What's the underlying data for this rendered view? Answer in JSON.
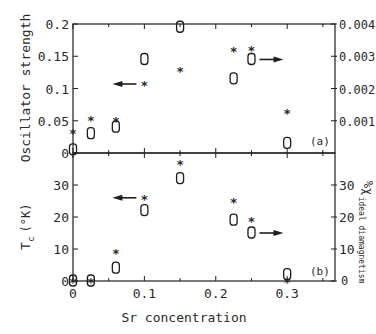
{
  "chart_data": [
    {
      "panel": "(a)",
      "type": "scatter",
      "xlabel": "Sr concentration",
      "ylabel_left": "Oscillator strength",
      "ylabel_right": "χ",
      "xlim": [
        0,
        0.367
      ],
      "ylim_left": [
        0,
        0.2
      ],
      "ylim_right": [
        0,
        0.004
      ],
      "yticks_left": [
        "0",
        "0.05",
        "0.1",
        "0.15",
        "0.2"
      ],
      "yticks_left_values": [
        0,
        0.05,
        0.1,
        0.15,
        0.2
      ],
      "yticks_right": [
        "0.001",
        "0.002",
        "0.003",
        "0.004"
      ],
      "yticks_right_values": [
        0.001,
        0.002,
        0.003,
        0.004
      ],
      "series": [
        {
          "name": "Oscillator strength",
          "marker": "*",
          "axis": "left",
          "x": [
            0,
            0.025,
            0.06,
            0.1,
            0.15,
            0.225,
            0.25,
            0.3
          ],
          "y": [
            0.033,
            0.052,
            0.051,
            0.107,
            0.129,
            0.16,
            0.162,
            0.064
          ]
        },
        {
          "name": "χ",
          "marker": "0",
          "axis": "right",
          "x": [
            0,
            0.025,
            0.06,
            0.1,
            0.15,
            0.225,
            0.25,
            0.3
          ],
          "y": [
            0.0001,
            0.0006,
            0.0008,
            0.0029,
            0.0039,
            0.0023,
            0.0029,
            0.0003
          ]
        }
      ],
      "annotations": [
        {
          "type": "arrow-left",
          "x": 0.1,
          "y": 0.107,
          "meaning": "stars refer to left axis"
        },
        {
          "type": "arrow-right",
          "x": 0.25,
          "y": 0.0029,
          "meaning": "zeros refer to right axis"
        },
        {
          "type": "label",
          "text": "(a)"
        }
      ]
    },
    {
      "panel": "(b)",
      "type": "scatter",
      "xlabel": "Sr concentration",
      "ylabel_left": "Tc (°K)",
      "ylabel_right": "χ ideal diamagnetism (%)",
      "xlim": [
        0,
        0.367
      ],
      "ylim_left": [
        0,
        40
      ],
      "ylim_right": [
        0,
        40
      ],
      "yticks_left": [
        "0",
        "10",
        "20",
        "30"
      ],
      "yticks_left_values": [
        0,
        10,
        20,
        30
      ],
      "yticks_right": [
        "0",
        "10",
        "20",
        "30"
      ],
      "yticks_right_values": [
        0,
        10,
        20,
        30
      ],
      "xticks": [
        "0",
        "0.1",
        "0.2",
        "0.3"
      ],
      "xticks_values": [
        0,
        0.1,
        0.2,
        0.3
      ],
      "series": [
        {
          "name": "Tc",
          "marker": "*",
          "axis": "left",
          "x": [
            0,
            0.025,
            0.06,
            0.1,
            0.15,
            0.225,
            0.25,
            0.3
          ],
          "y": [
            0,
            0,
            9,
            26,
            37,
            25,
            19,
            0
          ]
        },
        {
          "name": "χ ideal diamagnetism",
          "marker": "0",
          "axis": "right",
          "x": [
            0,
            0.025,
            0.06,
            0.1,
            0.15,
            0.225,
            0.25,
            0.3
          ],
          "y": [
            0,
            0,
            4,
            22,
            32,
            19,
            15,
            2
          ]
        }
      ],
      "annotations": [
        {
          "type": "arrow-left",
          "x": 0.1,
          "y": 26,
          "meaning": "stars refer to left axis"
        },
        {
          "type": "arrow-right",
          "x": 0.25,
          "y": 15,
          "meaning": "zeros refer to right axis"
        },
        {
          "type": "label",
          "text": "(b)"
        }
      ]
    }
  ],
  "labels": {
    "xlabel": "Sr concentration",
    "top_ylabel_left": "Oscillator strength",
    "bottom_ylabel_left_main": "T",
    "bottom_ylabel_left_sub": "c",
    "bottom_ylabel_left_unit": "(°K)",
    "bottom_ylabel_right": "%χ",
    "bottom_ylabel_right_sub": "ideal diamagnetism",
    "panel_a": "(a)",
    "panel_b": "(b)"
  }
}
